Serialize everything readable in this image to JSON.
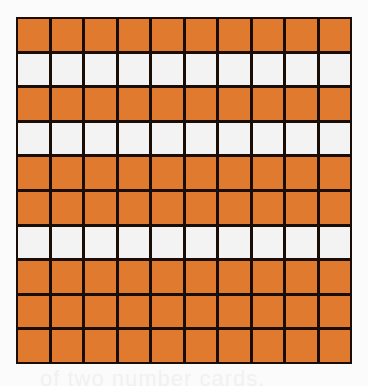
{
  "figure": {
    "type": "hundred-grid",
    "rows": 10,
    "columns": 10,
    "shaded_color": "#e07a2e",
    "unshaded_color": "#f3f3f3",
    "line_color": "#1a0d06",
    "unshaded_rows": [
      2,
      4,
      7
    ],
    "shaded_rows": [
      1,
      3,
      5,
      6,
      8,
      9,
      10
    ],
    "shaded_count": 70,
    "unshaded_count": 30,
    "total_cells": 100
  },
  "bleed_text": "of two number cards."
}
